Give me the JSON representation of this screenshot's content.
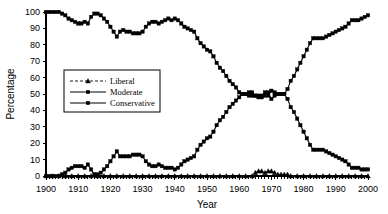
{
  "chart_data": {
    "type": "line",
    "title": "",
    "xlabel": "Year",
    "ylabel": "Percentage",
    "xlim": [
      1900,
      2000
    ],
    "ylim": [
      0,
      100
    ],
    "ytick_step": 10,
    "xtick_step": 10,
    "grid": false,
    "legend_position": "center-left",
    "xticks": [
      1900,
      1910,
      1920,
      1930,
      1940,
      1950,
      1960,
      1970,
      1980,
      1990,
      2000
    ],
    "yticks": [
      0,
      10,
      20,
      30,
      40,
      50,
      60,
      70,
      80,
      90,
      100
    ],
    "x": [
      1900,
      1901,
      1902,
      1903,
      1904,
      1905,
      1906,
      1907,
      1908,
      1909,
      1910,
      1911,
      1912,
      1913,
      1914,
      1915,
      1916,
      1917,
      1918,
      1919,
      1920,
      1921,
      1922,
      1923,
      1924,
      1925,
      1926,
      1927,
      1928,
      1929,
      1930,
      1931,
      1932,
      1933,
      1934,
      1935,
      1936,
      1937,
      1938,
      1939,
      1940,
      1941,
      1942,
      1943,
      1944,
      1945,
      1946,
      1947,
      1948,
      1949,
      1950,
      1951,
      1952,
      1953,
      1954,
      1955,
      1956,
      1957,
      1958,
      1959,
      1960,
      1961,
      1962,
      1963,
      1964,
      1965,
      1966,
      1967,
      1968,
      1969,
      1970,
      1971,
      1972,
      1973,
      1974,
      1975,
      1976,
      1977,
      1978,
      1979,
      1980,
      1981,
      1982,
      1983,
      1984,
      1985,
      1986,
      1987,
      1988,
      1989,
      1990,
      1991,
      1992,
      1993,
      1994,
      1995,
      1996,
      1997,
      1998,
      1999,
      2000
    ],
    "series": [
      {
        "name": "Liberal",
        "marker": "triangle",
        "linestyle": "dashed",
        "values": [
          0,
          0,
          0,
          0,
          0,
          0,
          0,
          0,
          0,
          0,
          0,
          0,
          0,
          0,
          0,
          0,
          0,
          0,
          0,
          0,
          0,
          0,
          0,
          0,
          0,
          0,
          0,
          0,
          0,
          0,
          0,
          0,
          0,
          0,
          0,
          0,
          0,
          0,
          0,
          0,
          0,
          0,
          0,
          0,
          0,
          0,
          0,
          0,
          0,
          0,
          0,
          0,
          0,
          0,
          0,
          0,
          0,
          0,
          0,
          0,
          0,
          0,
          0,
          0,
          0,
          2,
          3,
          3,
          2,
          3,
          3,
          2,
          1,
          1,
          1,
          1,
          0,
          0,
          0,
          0,
          0,
          0,
          0,
          0,
          0,
          0,
          0,
          0,
          0,
          0,
          0,
          0,
          0,
          0,
          0,
          0,
          0,
          0,
          0,
          0,
          0
        ]
      },
      {
        "name": "Moderate",
        "marker": "square",
        "linestyle": "solid",
        "values": [
          0,
          0,
          0,
          0,
          0,
          1,
          2,
          4,
          5,
          6,
          6,
          6,
          5,
          7,
          4,
          1,
          1,
          2,
          4,
          6,
          9,
          12,
          15,
          12,
          12,
          12,
          12,
          13,
          13,
          13,
          12,
          9,
          7,
          6,
          6,
          7,
          6,
          5,
          5,
          5,
          4,
          5,
          7,
          9,
          10,
          11,
          12,
          16,
          19,
          21,
          23,
          24,
          27,
          31,
          34,
          36,
          39,
          42,
          44,
          46,
          48,
          50,
          50,
          49,
          49,
          49,
          49,
          48,
          49,
          51,
          47,
          49,
          50,
          50,
          50,
          47,
          42,
          39,
          35,
          31,
          27,
          23,
          19,
          16,
          16,
          16,
          16,
          15,
          14,
          13,
          12,
          11,
          10,
          9,
          7,
          5,
          5,
          5,
          4,
          4,
          4
        ]
      },
      {
        "name": "Conservative",
        "marker": "square",
        "linestyle": "solid",
        "values": [
          100,
          100,
          100,
          100,
          100,
          99,
          98,
          96,
          95,
          94,
          93,
          93,
          94,
          93,
          97,
          99,
          99,
          98,
          96,
          94,
          91,
          88,
          85,
          88,
          89,
          88,
          88,
          87,
          87,
          87,
          88,
          91,
          93,
          94,
          94,
          93,
          94,
          95,
          96,
          95,
          96,
          95,
          93,
          91,
          90,
          89,
          88,
          84,
          81,
          79,
          77,
          76,
          73,
          69,
          66,
          64,
          61,
          58,
          56,
          54,
          51,
          50,
          50,
          51,
          51,
          49,
          48,
          49,
          51,
          49,
          52,
          51,
          50,
          50,
          50,
          53,
          58,
          61,
          65,
          69,
          73,
          77,
          81,
          84,
          84,
          84,
          84,
          85,
          86,
          87,
          88,
          89,
          90,
          91,
          93,
          95,
          95,
          95,
          96,
          97,
          98
        ]
      }
    ]
  },
  "legend": {
    "items": [
      {
        "label": "Liberal"
      },
      {
        "label": "Moderate"
      },
      {
        "label": "Conservative"
      }
    ]
  },
  "axes": {
    "x_title": "Year",
    "y_title": "Percentage"
  }
}
